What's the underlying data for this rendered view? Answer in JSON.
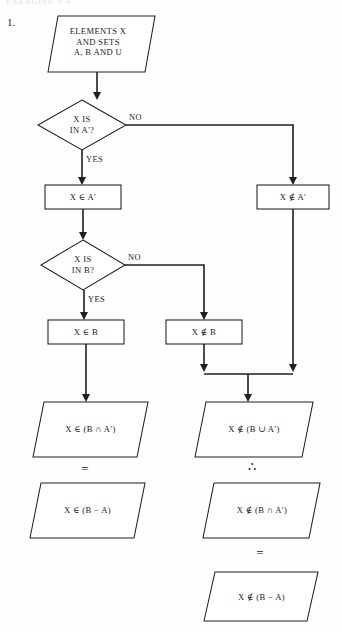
{
  "page": {
    "running_header": "EXERCISE 5-4",
    "item_number": "1.",
    "background_color": "#fefefe",
    "ink_color": "#1f1f1f"
  },
  "flowchart": {
    "title": "Set membership decision flowchart for (B - A)",
    "nodes": [
      {
        "id": "start",
        "shape": "parallelogram",
        "role": "input",
        "text": "ELEMENTS X\nAND SETS\nA, B AND U"
      },
      {
        "id": "decision-a",
        "shape": "diamond",
        "role": "decision",
        "text": "X IS\nIN A'?"
      },
      {
        "id": "in-a-prime",
        "shape": "rectangle",
        "role": "process",
        "text": "X ∈ A′"
      },
      {
        "id": "not-in-a-prime",
        "shape": "rectangle",
        "role": "process",
        "text": "X ∉ A′"
      },
      {
        "id": "decision-b",
        "shape": "diamond",
        "role": "decision",
        "text": "X IS\nIN B?"
      },
      {
        "id": "in-b",
        "shape": "rectangle",
        "role": "process",
        "text": "X ∈ B"
      },
      {
        "id": "not-in-b",
        "shape": "rectangle",
        "role": "process",
        "text": "X ∉ B"
      },
      {
        "id": "result-intersect",
        "shape": "parallelogram",
        "role": "output",
        "text": "X ∈ (B ∩ A′)"
      },
      {
        "id": "result-b-minus-a",
        "shape": "parallelogram",
        "role": "output",
        "text": "X ∈ (B − A)"
      },
      {
        "id": "result-union",
        "shape": "parallelogram",
        "role": "output",
        "text": "X ∉ (B ∪ A′)"
      },
      {
        "id": "result-not-intersect",
        "shape": "parallelogram",
        "role": "output",
        "text": "X ∉ (B ∩ A′)"
      },
      {
        "id": "result-not-b-minus-a",
        "shape": "parallelogram",
        "role": "output",
        "text": "X ∉ (B − A)"
      }
    ],
    "edge_labels": [
      {
        "id": "a-no",
        "text": "NO"
      },
      {
        "id": "a-yes",
        "text": "YES"
      },
      {
        "id": "b-no",
        "text": "NO"
      },
      {
        "id": "b-yes",
        "text": "YES"
      }
    ],
    "relation_symbols": [
      {
        "id": "left-equals",
        "text": "="
      },
      {
        "id": "right-therefore",
        "text": "∴"
      },
      {
        "id": "right-equals",
        "text": "="
      }
    ]
  }
}
